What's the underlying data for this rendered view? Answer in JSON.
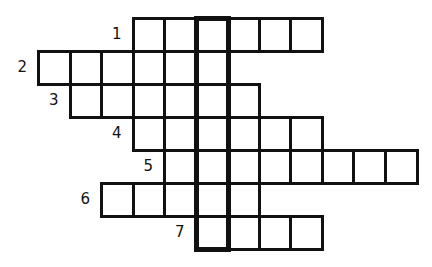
{
  "puzzle": {
    "type": "crossword",
    "grid": {
      "origin_x": 37,
      "origin_y": 17,
      "cell_w": 31.5,
      "cell_h": 33,
      "columns": 12,
      "rows": 7
    },
    "highlighted_column": 5,
    "entries": [
      {
        "number": "1",
        "row": 0,
        "start_col": 3,
        "length": 6
      },
      {
        "number": "2",
        "row": 1,
        "start_col": 0,
        "length": 6
      },
      {
        "number": "3",
        "row": 2,
        "start_col": 1,
        "length": 6
      },
      {
        "number": "4",
        "row": 3,
        "start_col": 3,
        "length": 6
      },
      {
        "number": "5",
        "row": 4,
        "start_col": 4,
        "length": 8
      },
      {
        "number": "6",
        "row": 5,
        "start_col": 2,
        "length": 5
      },
      {
        "number": "7",
        "row": 6,
        "start_col": 5,
        "length": 4
      }
    ],
    "colors": {
      "line": "#111111",
      "background": "#ffffff"
    }
  }
}
